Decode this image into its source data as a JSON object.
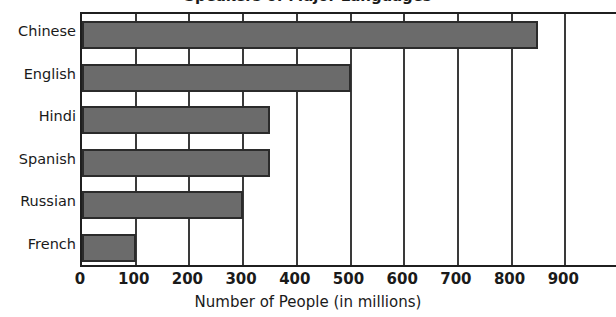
{
  "chart_data": {
    "type": "bar",
    "orientation": "horizontal",
    "title": "Speakers of Major Languages",
    "xlabel": "Number of People (in millions)",
    "ylabel": "",
    "categories": [
      "Chinese",
      "English",
      "Hindi",
      "Spanish",
      "Russian",
      "French"
    ],
    "values": [
      850,
      500,
      350,
      350,
      300,
      100
    ],
    "xlim": [
      0,
      1000
    ],
    "xticks": [
      0,
      100,
      200,
      300,
      400,
      500,
      600,
      700,
      800,
      900
    ],
    "xtick_labels": [
      "0",
      "100",
      "200",
      "300",
      "400",
      "500",
      "600",
      "700",
      "800",
      "900"
    ],
    "grid": true,
    "grid_axis": "x",
    "legend": false,
    "bar_color": "#6b6b6b",
    "bar_edge_color": "#2b2b2b",
    "axis_color": "#1f1f1f",
    "background_color": "#ffffff",
    "text_color": "#1a1a1a"
  }
}
